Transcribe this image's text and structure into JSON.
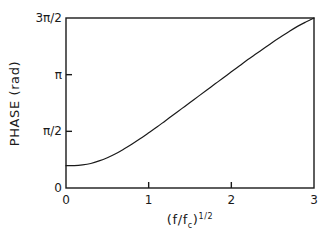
{
  "chart_data": {
    "type": "line",
    "title": "",
    "xlabel": "(f/f_c)^1/2",
    "ylabel": "PHASE (rad)",
    "xlim": [
      0,
      3
    ],
    "ylim": [
      0,
      4.71238898
    ],
    "grid": false,
    "legend": null,
    "x_ticks": [
      {
        "value": 0,
        "label": "0"
      },
      {
        "value": 1,
        "label": "1"
      },
      {
        "value": 2,
        "label": "2"
      },
      {
        "value": 3,
        "label": "3"
      }
    ],
    "y_ticks": [
      {
        "value": 0,
        "label": "0"
      },
      {
        "value": 1.5707963,
        "label": "π/2"
      },
      {
        "value": 3.1415927,
        "label": "π"
      },
      {
        "value": 4.712389,
        "label": "3π/2"
      }
    ],
    "series": [
      {
        "name": "phase",
        "color": "#1a1a1a",
        "x": [
          0.0,
          0.1,
          0.2,
          0.3,
          0.4,
          0.5,
          0.6,
          0.7,
          0.8,
          0.9,
          1.0,
          1.1,
          1.2,
          1.3,
          1.4,
          1.5,
          1.6,
          1.7,
          1.8,
          1.9,
          2.0,
          2.1,
          2.2,
          2.3,
          2.4,
          2.5,
          2.6,
          2.7,
          2.8,
          2.9,
          3.0
        ],
        "y": [
          0.62,
          0.62,
          0.64,
          0.68,
          0.75,
          0.84,
          0.95,
          1.08,
          1.22,
          1.37,
          1.53,
          1.69,
          1.86,
          2.03,
          2.2,
          2.37,
          2.54,
          2.71,
          2.88,
          3.05,
          3.22,
          3.39,
          3.56,
          3.72,
          3.88,
          4.04,
          4.19,
          4.34,
          4.48,
          4.6,
          4.71
        ]
      }
    ]
  },
  "axes": {
    "y_title_text": "PHASE (rad)",
    "x_title_prefix": "(f/f",
    "x_title_sub": "c",
    "x_title_mid": ")",
    "x_title_sup": "1/2"
  },
  "ticks": {
    "y": [
      "3π/2",
      "π",
      "π/2",
      "0"
    ],
    "x": [
      "0",
      "1",
      "2",
      "3"
    ]
  },
  "style": {
    "line_color": "#1a1a1a",
    "frame_color": "#1a1a1a",
    "background": "#ffffff"
  }
}
